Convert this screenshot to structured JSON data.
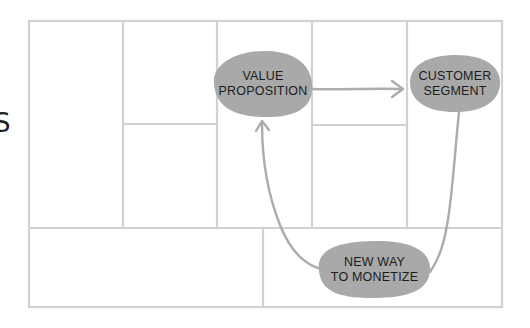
{
  "diagram": {
    "type": "business-model-canvas-flow",
    "edge_glyph": "S",
    "colors": {
      "grid": "#d2d2d2",
      "blob_fill": "#a9a9a9",
      "connector": "#acacac",
      "text": "#1c1c1c",
      "background": "#ffffff"
    },
    "nodes": [
      {
        "id": "value_proposition",
        "line1": "VALUE",
        "line2": "PROPOSITION"
      },
      {
        "id": "customer_segment",
        "line1": "CUSTOMER",
        "line2": "SEGMENT"
      },
      {
        "id": "new_way_to_monetize",
        "line1": "NEW WAY",
        "line2": "TO MONETIZE"
      }
    ],
    "edges": [
      {
        "from": "value_proposition",
        "to": "customer_segment",
        "style": "arrow"
      },
      {
        "from": "customer_segment",
        "to": "new_way_to_monetize",
        "style": "line"
      },
      {
        "from": "new_way_to_monetize",
        "to": "value_proposition",
        "style": "arrow"
      }
    ],
    "canvas_blocks": {
      "top_columns": 5,
      "split_columns": [
        2,
        4
      ],
      "bottom_sections": 2
    }
  }
}
